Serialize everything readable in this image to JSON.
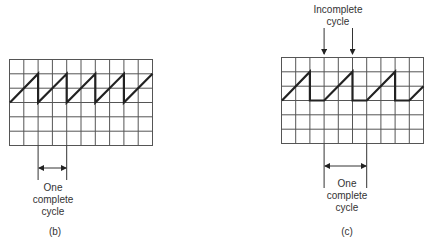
{
  "figures": [
    {
      "id": "b",
      "caption": "(b)",
      "measure_label": [
        "One",
        "complete",
        "cycle"
      ],
      "grid": {
        "cols": 10,
        "rows": 6
      },
      "waveform": "sawtooth, continuous, period 2 divisions"
    },
    {
      "id": "c",
      "caption": "(c)",
      "top_label": [
        "Incomplete",
        "cycle"
      ],
      "measure_label": [
        "One",
        "complete",
        "cycle"
      ],
      "grid": {
        "cols": 10,
        "rows": 6
      },
      "waveform": "sawtooth with flat segment, period 3 divisions"
    }
  ],
  "colors": {
    "grid": "#555555",
    "trace": "#222222"
  }
}
